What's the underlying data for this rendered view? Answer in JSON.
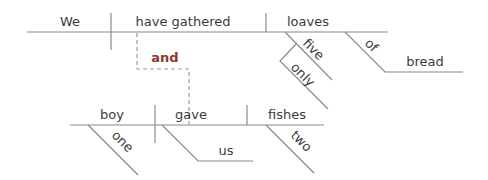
{
  "diagram": {
    "type": "sentence-diagram",
    "sentence": "We have gathered only five loaves of bread, and one boy gave us two fishes.",
    "clause1": {
      "subject": "We",
      "verb": "have gathered",
      "object": "loaves",
      "modifiers": {
        "five": "five",
        "only": "only",
        "preposition": "of",
        "prep_object": "bread"
      }
    },
    "conjunction": "and",
    "clause2": {
      "subject": "boy",
      "verb": "gave",
      "object": "fishes",
      "modifiers": {
        "one": "one",
        "indirect_object": "us",
        "two": "two"
      }
    },
    "colors": {
      "line": "#8a8a8a",
      "text": "#3a3a3a",
      "conjunction": "#8b3a2a"
    }
  }
}
